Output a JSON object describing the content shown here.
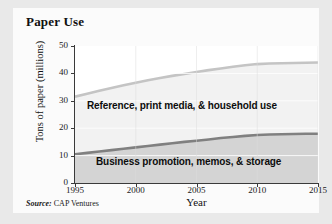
{
  "chart_data": {
    "type": "area",
    "title": "Paper Use",
    "xlabel": "Year",
    "ylabel": "Tons of paper (millions)",
    "xlim": [
      1995,
      2015
    ],
    "ylim": [
      0,
      50
    ],
    "x": [
      1995,
      1996,
      1997,
      1998,
      1999,
      2000,
      2001,
      2002,
      2003,
      2004,
      2005,
      2006,
      2007,
      2008,
      2009,
      2010,
      2011,
      2012,
      2013,
      2014,
      2015
    ],
    "x_ticks": [
      "1995",
      "2000",
      "2005",
      "2010",
      "2015"
    ],
    "x_tick_values": [
      1995,
      2000,
      2005,
      2010,
      2015
    ],
    "y_ticks": [
      "0",
      "10",
      "20",
      "30",
      "40",
      "50"
    ],
    "y_tick_values": [
      0,
      10,
      20,
      30,
      40,
      50
    ],
    "grid": true,
    "legend_position": "inline-band-labels",
    "stacked": true,
    "series": [
      {
        "name": "Business promotion, memos, & storage",
        "color": "#808080",
        "band_fill": "#d4d4d4",
        "values": [
          10.5,
          11.0,
          11.5,
          12.0,
          12.5,
          13.0,
          13.5,
          14.0,
          14.5,
          15.0,
          15.4,
          15.9,
          16.4,
          16.8,
          17.2,
          17.5,
          17.7,
          17.8,
          17.9,
          18.0,
          18.0
        ]
      },
      {
        "name": "Reference, print media, & household use",
        "color": "#c4c4c4",
        "band_fill": "#f2f2f2",
        "cumulative_values": [
          31.5,
          32.6,
          33.7,
          34.7,
          35.7,
          36.6,
          37.5,
          38.3,
          39.1,
          39.8,
          40.5,
          41.2,
          41.8,
          42.4,
          43.0,
          43.4,
          43.6,
          43.7,
          43.8,
          43.9,
          44.0
        ]
      }
    ],
    "source": {
      "prefix": "Source:",
      "text": "CAP Ventures"
    }
  },
  "labels": {
    "band_upper": "Reference, print media, & household use",
    "band_lower": "Business promotion, memos, & storage"
  },
  "colors": {
    "page_background": "#e9e9e9",
    "card_background": "#fbfbfb",
    "plot_background": "#ffffff",
    "axis": "#3a3a3a",
    "gridline": "#eeeeee",
    "upper_line": "#c4c4c4",
    "lower_line": "#808080",
    "upper_band": "#f2f2f2",
    "lower_band": "#d4d4d4",
    "text": "#101010"
  }
}
